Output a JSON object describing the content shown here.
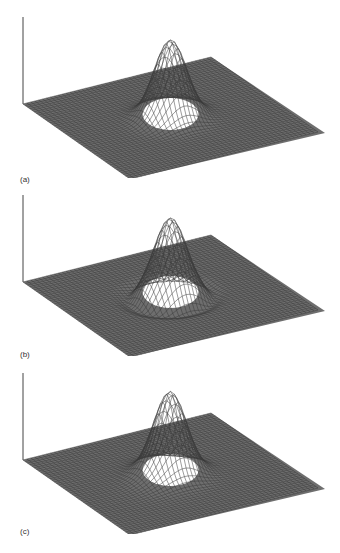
{
  "figure": {
    "panels": [
      {
        "id": "a",
        "label": "(a)",
        "top": 0,
        "ring": false,
        "asym": false,
        "label_y": 175
      },
      {
        "id": "b",
        "label": "(b)",
        "top": 178,
        "ring": true,
        "asym": false,
        "label_y": 350
      },
      {
        "id": "c",
        "label": "(c)",
        "top": 356,
        "ring": false,
        "asym": true,
        "label_y": 527
      }
    ],
    "colors": {
      "mesh": "#3a3a3a",
      "plane": "#6e6e6e",
      "axis": "#444444",
      "background": "#ffffff"
    }
  }
}
